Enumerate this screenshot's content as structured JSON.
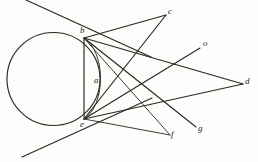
{
  "figure": {
    "background_color": "#fdfdfb",
    "ink_color": "#2b2722",
    "width": 258,
    "height": 162,
    "circle": {
      "name": "main-circle",
      "cx": 53.5,
      "cy": 79,
      "r": 46.5
    },
    "inner_arc": {
      "name": "inner-arc-a",
      "from": "b",
      "to": "e",
      "bulge_x": 104,
      "description": "arc bulging right from b to e, labelled a"
    },
    "points": [
      {
        "id": "b",
        "label": "b",
        "x": 84,
        "y": 38,
        "label_x": 80,
        "label_y": 26
      },
      {
        "id": "c",
        "label": "c",
        "x": 166,
        "y": 15,
        "label_x": 168,
        "label_y": 7
      },
      {
        "id": "o",
        "label": "o",
        "x": 200,
        "y": 48,
        "label_x": 203,
        "label_y": 39
      },
      {
        "id": "a",
        "label": "a",
        "x": 99,
        "y": 82,
        "label_x": 94,
        "label_y": 76
      },
      {
        "id": "d",
        "label": "d",
        "x": 243,
        "y": 84,
        "label_x": 245,
        "label_y": 77
      },
      {
        "id": "e",
        "label": "e",
        "x": 84,
        "y": 119,
        "label_x": 80,
        "label_y": 120
      },
      {
        "id": "g",
        "label": "g",
        "x": 196,
        "y": 127,
        "label_x": 198,
        "label_y": 124
      },
      {
        "id": "f",
        "label": "f",
        "x": 170,
        "y": 135,
        "label_x": 171,
        "label_y": 130
      }
    ],
    "segments": [
      {
        "name": "chord-b-e",
        "x1": 84,
        "y1": 38,
        "x2": 84,
        "y2": 119
      },
      {
        "name": "line-b-c",
        "x1": 84,
        "y1": 38,
        "x2": 166,
        "y2": 15
      },
      {
        "name": "line-b-d",
        "x1": 84,
        "y1": 38,
        "x2": 243,
        "y2": 84
      },
      {
        "name": "line-b-f",
        "x1": 84,
        "y1": 38,
        "x2": 170,
        "y2": 135
      },
      {
        "name": "line-b-g",
        "x1": 84,
        "y1": 38,
        "x2": 196,
        "y2": 127
      },
      {
        "name": "line-e-c",
        "x1": 84,
        "y1": 119,
        "x2": 166,
        "y2": 15
      },
      {
        "name": "line-e-o",
        "x1": 84,
        "y1": 119,
        "x2": 200,
        "y2": 48
      },
      {
        "name": "line-e-d",
        "x1": 84,
        "y1": 119,
        "x2": 243,
        "y2": 84
      },
      {
        "name": "line-e-f",
        "x1": 84,
        "y1": 119,
        "x2": 170,
        "y2": 135
      },
      {
        "name": "tangent-through-b",
        "x1": 26,
        "y1": 0,
        "x2": 151,
        "y2": 57
      },
      {
        "name": "tangent-through-e",
        "x1": 22,
        "y1": 157,
        "x2": 152,
        "y2": 98
      }
    ]
  }
}
